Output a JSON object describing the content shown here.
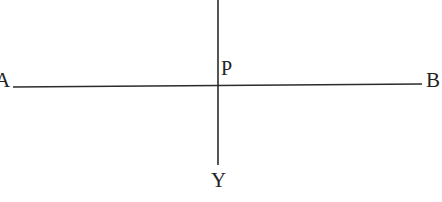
{
  "figure": {
    "kind": "geometry-line-diagram",
    "caption": "",
    "canvas": {
      "width": 442,
      "height": 202,
      "background_color": "#ffffff"
    },
    "ink_color": "#2b2b2b",
    "label_color": "#232323",
    "labels": {
      "a": "A",
      "b": "B",
      "p": "P",
      "y": "Y"
    },
    "segments": [
      {
        "name": "line-ab",
        "from_label": "A",
        "to_label": "B",
        "x1": 13,
        "y1": 87,
        "x2": 422,
        "y2": 84,
        "stroke_width": 1.5
      },
      {
        "name": "line-py",
        "from_label": "",
        "to_label": "Y",
        "x1": 218,
        "y1": 0,
        "x2": 218,
        "y2": 165,
        "stroke_width": 1.6
      }
    ],
    "points": [
      {
        "name": "intersection-p",
        "label": "P",
        "x": 218,
        "y": 86
      }
    ]
  }
}
